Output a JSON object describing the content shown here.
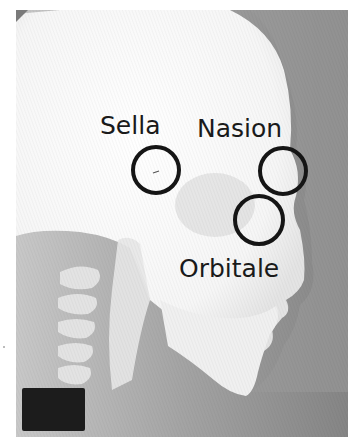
{
  "figure": {
    "colors": {
      "background": "#8a8a8a",
      "bone": "#f4f4f4",
      "annotation": "#151515",
      "marker_block": "#1c1c1c"
    }
  },
  "landmarks": [
    {
      "id": "sella",
      "label": "Sella",
      "circle": {
        "cx": 156,
        "cy": 170,
        "r": 23
      },
      "text": {
        "x": 100,
        "y": 134
      }
    },
    {
      "id": "nasion",
      "label": "Nasion",
      "circle": {
        "cx": 283,
        "cy": 171,
        "r": 23
      },
      "text": {
        "x": 197,
        "y": 137
      }
    },
    {
      "id": "orbitale",
      "label": "Orbitale",
      "circle": {
        "cx": 259,
        "cy": 220,
        "r": 24
      },
      "text": {
        "x": 179,
        "y": 277
      }
    }
  ]
}
